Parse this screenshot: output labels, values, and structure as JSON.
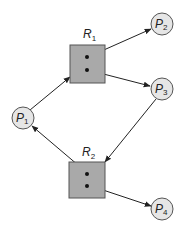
{
  "diagram": {
    "type": "resource-allocation-graph",
    "colors": {
      "process_fill": "#e6e6e6",
      "resource_fill": "#a9a9a9",
      "stroke": "#555555",
      "edge": "#222222",
      "background": "#ffffff"
    },
    "processes": [
      {
        "id": "P1",
        "letter": "P",
        "sub": "1"
      },
      {
        "id": "P2",
        "letter": "P",
        "sub": "2"
      },
      {
        "id": "P3",
        "letter": "P",
        "sub": "3"
      },
      {
        "id": "P4",
        "letter": "P",
        "sub": "4"
      }
    ],
    "resources": [
      {
        "id": "R1",
        "letter": "R",
        "sub": "1",
        "instances": 2
      },
      {
        "id": "R2",
        "letter": "R",
        "sub": "2",
        "instances": 2
      }
    ],
    "edges": [
      {
        "from": "P1",
        "to": "R1",
        "kind": "request"
      },
      {
        "from": "R1",
        "to": "P2",
        "kind": "assignment"
      },
      {
        "from": "R1",
        "to": "P3",
        "kind": "assignment"
      },
      {
        "from": "P3",
        "to": "R2",
        "kind": "request"
      },
      {
        "from": "R2",
        "to": "P1",
        "kind": "assignment"
      },
      {
        "from": "R2",
        "to": "P4",
        "kind": "assignment"
      }
    ]
  }
}
